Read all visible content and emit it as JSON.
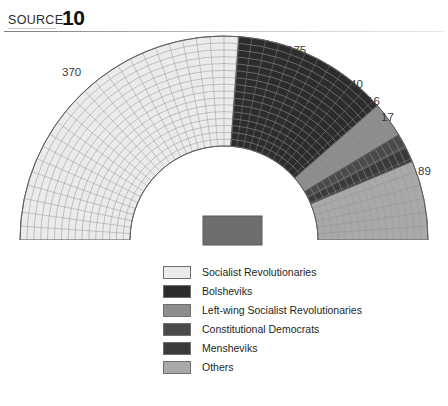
{
  "header": {
    "source_word": "SOURCE",
    "source_number": "10"
  },
  "podium": {
    "color": "#6e6e6e"
  },
  "legend": {
    "items": [
      {
        "label": "Socialist Revolutionaries",
        "color": "#eceaea"
      },
      {
        "label": "Bolsheviks",
        "color": "#2c2c2c"
      },
      {
        "label": "Left-wing Socialist Revolutionaries",
        "color": "#8d8d8d"
      },
      {
        "label": "Constitutional Democrats",
        "color": "#4a4a4a"
      },
      {
        "label": "Mensheviks",
        "color": "#3a3a3a"
      },
      {
        "label": "Others",
        "color": "#a9a9a9"
      }
    ]
  },
  "chart_data": {
    "type": "pie",
    "title": "",
    "subtype": "semicircle-hemicycle-parliament",
    "total_seats": 707,
    "categories": [
      "Socialist Revolutionaries",
      "Bolsheviks",
      "Left-wing Socialist Revolutionaries",
      "Constitutional Democrats",
      "Mensheviks",
      "Others"
    ],
    "values": [
      370,
      175,
      40,
      16,
      17,
      89
    ],
    "colors": [
      "#eceaea",
      "#2c2c2c",
      "#8d8d8d",
      "#4a4a4a",
      "#3a3a3a",
      "#a9a9a9"
    ],
    "value_labels": [
      "370",
      "175",
      "40",
      "16",
      "17",
      "89"
    ],
    "legend_position": "bottom",
    "grid": false,
    "rings": 16,
    "sweep_degrees": 180,
    "xlabel": "",
    "ylabel": ""
  },
  "labels": {
    "l370": "370",
    "l175": "175",
    "l40": "40",
    "l16": "16",
    "l17": "17",
    "l89": "89"
  }
}
